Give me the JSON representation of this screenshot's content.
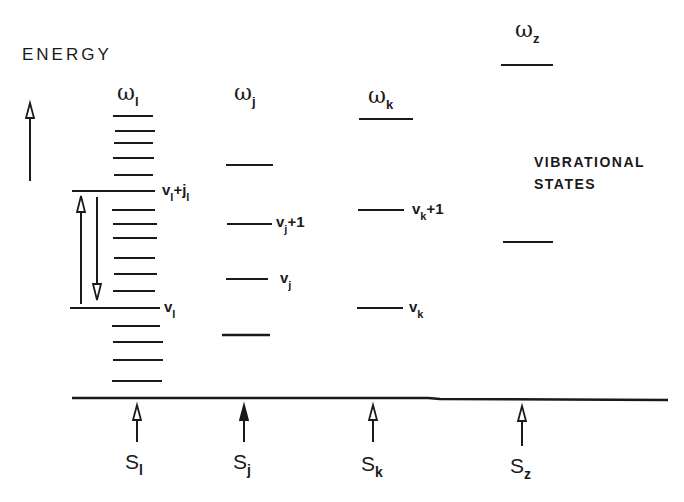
{
  "diagram": {
    "axis_title": "ENERGY",
    "caption_line1": "VIBRATIONAL",
    "caption_line2": "STATES",
    "ink_color": "#1a1a1a",
    "background": "#ffffff"
  },
  "modes": [
    {
      "id": "l",
      "omega_symbol": "ω",
      "omega_sub": "l",
      "source_symbol": "S",
      "source_sub": "l",
      "levels_y": [
        116,
        131,
        143,
        158,
        175,
        210,
        224,
        238,
        258,
        274,
        291,
        326,
        342,
        360,
        381
      ],
      "labeled_levels": [
        {
          "name": "v",
          "sub": "l",
          "suffix": "+",
          "suffix_sym": "j",
          "suffix_sub": "l",
          "y": 191
        },
        {
          "name": "v",
          "sub": "l",
          "suffix": "",
          "y": 308
        }
      ],
      "transition_arrows": [
        "up: v_l → v_l+j_l",
        "down: v_l+j_l → v_l"
      ]
    },
    {
      "id": "j",
      "omega_symbol": "ω",
      "omega_sub": "j",
      "source_symbol": "S",
      "source_sub": "j",
      "levels_y": [
        165,
        335
      ],
      "labeled_levels": [
        {
          "name": "v",
          "sub": "j",
          "suffix": "+1",
          "y": 224
        },
        {
          "name": "v",
          "sub": "j",
          "suffix": "",
          "y": 279
        }
      ]
    },
    {
      "id": "k",
      "omega_symbol": "ω",
      "omega_sub": "k",
      "source_symbol": "S",
      "source_sub": "k",
      "levels_y": [
        119
      ],
      "labeled_levels": [
        {
          "name": "v",
          "sub": "k",
          "suffix": "+1",
          "y": 210
        },
        {
          "name": "v",
          "sub": "k",
          "suffix": "",
          "y": 308
        }
      ]
    },
    {
      "id": "z",
      "omega_symbol": "ω",
      "omega_sub": "z",
      "source_symbol": "S",
      "source_sub": "z",
      "levels_y": [
        65,
        242
      ],
      "labeled_levels": []
    }
  ]
}
